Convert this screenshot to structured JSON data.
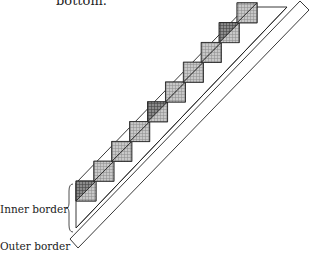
{
  "caption": "bottom.",
  "labels": {
    "inner_border": "Inner border",
    "outer_border": "Outer border"
  },
  "colors": {
    "line": "#222222",
    "fill_light": "#bdbdbd",
    "fill_dark": "#7a7a7a",
    "background": "#ffffff"
  },
  "diagram": {
    "type": "quilt-diagonal-strip",
    "blocks": 10
  }
}
